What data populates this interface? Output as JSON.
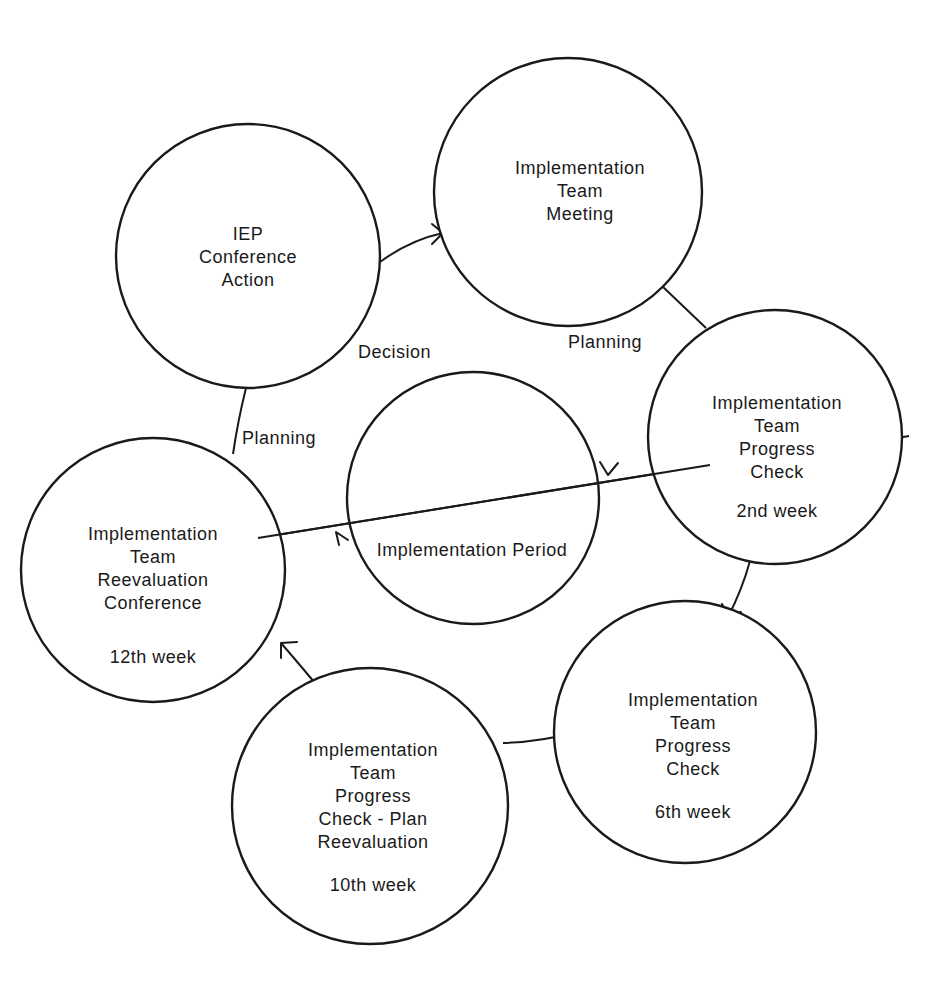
{
  "diagram": {
    "nodes": [
      {
        "id": "iep",
        "lines": [
          "IEP",
          "Conference",
          "Action"
        ]
      },
      {
        "id": "meeting",
        "lines": [
          "Implementation",
          "Team",
          "Meeting"
        ]
      },
      {
        "id": "check2",
        "lines": [
          "Implementation",
          "Team",
          "Progress",
          "Check",
          "",
          "2nd week"
        ]
      },
      {
        "id": "check6",
        "lines": [
          "Implementation",
          "Team",
          "Progress",
          "Check",
          "",
          "6th week"
        ]
      },
      {
        "id": "check10",
        "lines": [
          "Implementation",
          "Team",
          "Progress",
          "Check - Plan",
          "Reevaluation",
          "",
          "10th week"
        ]
      },
      {
        "id": "reeval12",
        "lines": [
          "Implementation",
          "Team",
          "Reevaluation",
          "Conference",
          "",
          "12th week"
        ]
      },
      {
        "id": "period",
        "lines": [
          "Implementation Period"
        ]
      }
    ],
    "edge_labels": {
      "decision": "Decision",
      "planning_top": "Planning",
      "planning_left": "Planning"
    },
    "line_color": "#1a1a1a",
    "background": "#ffffff"
  }
}
